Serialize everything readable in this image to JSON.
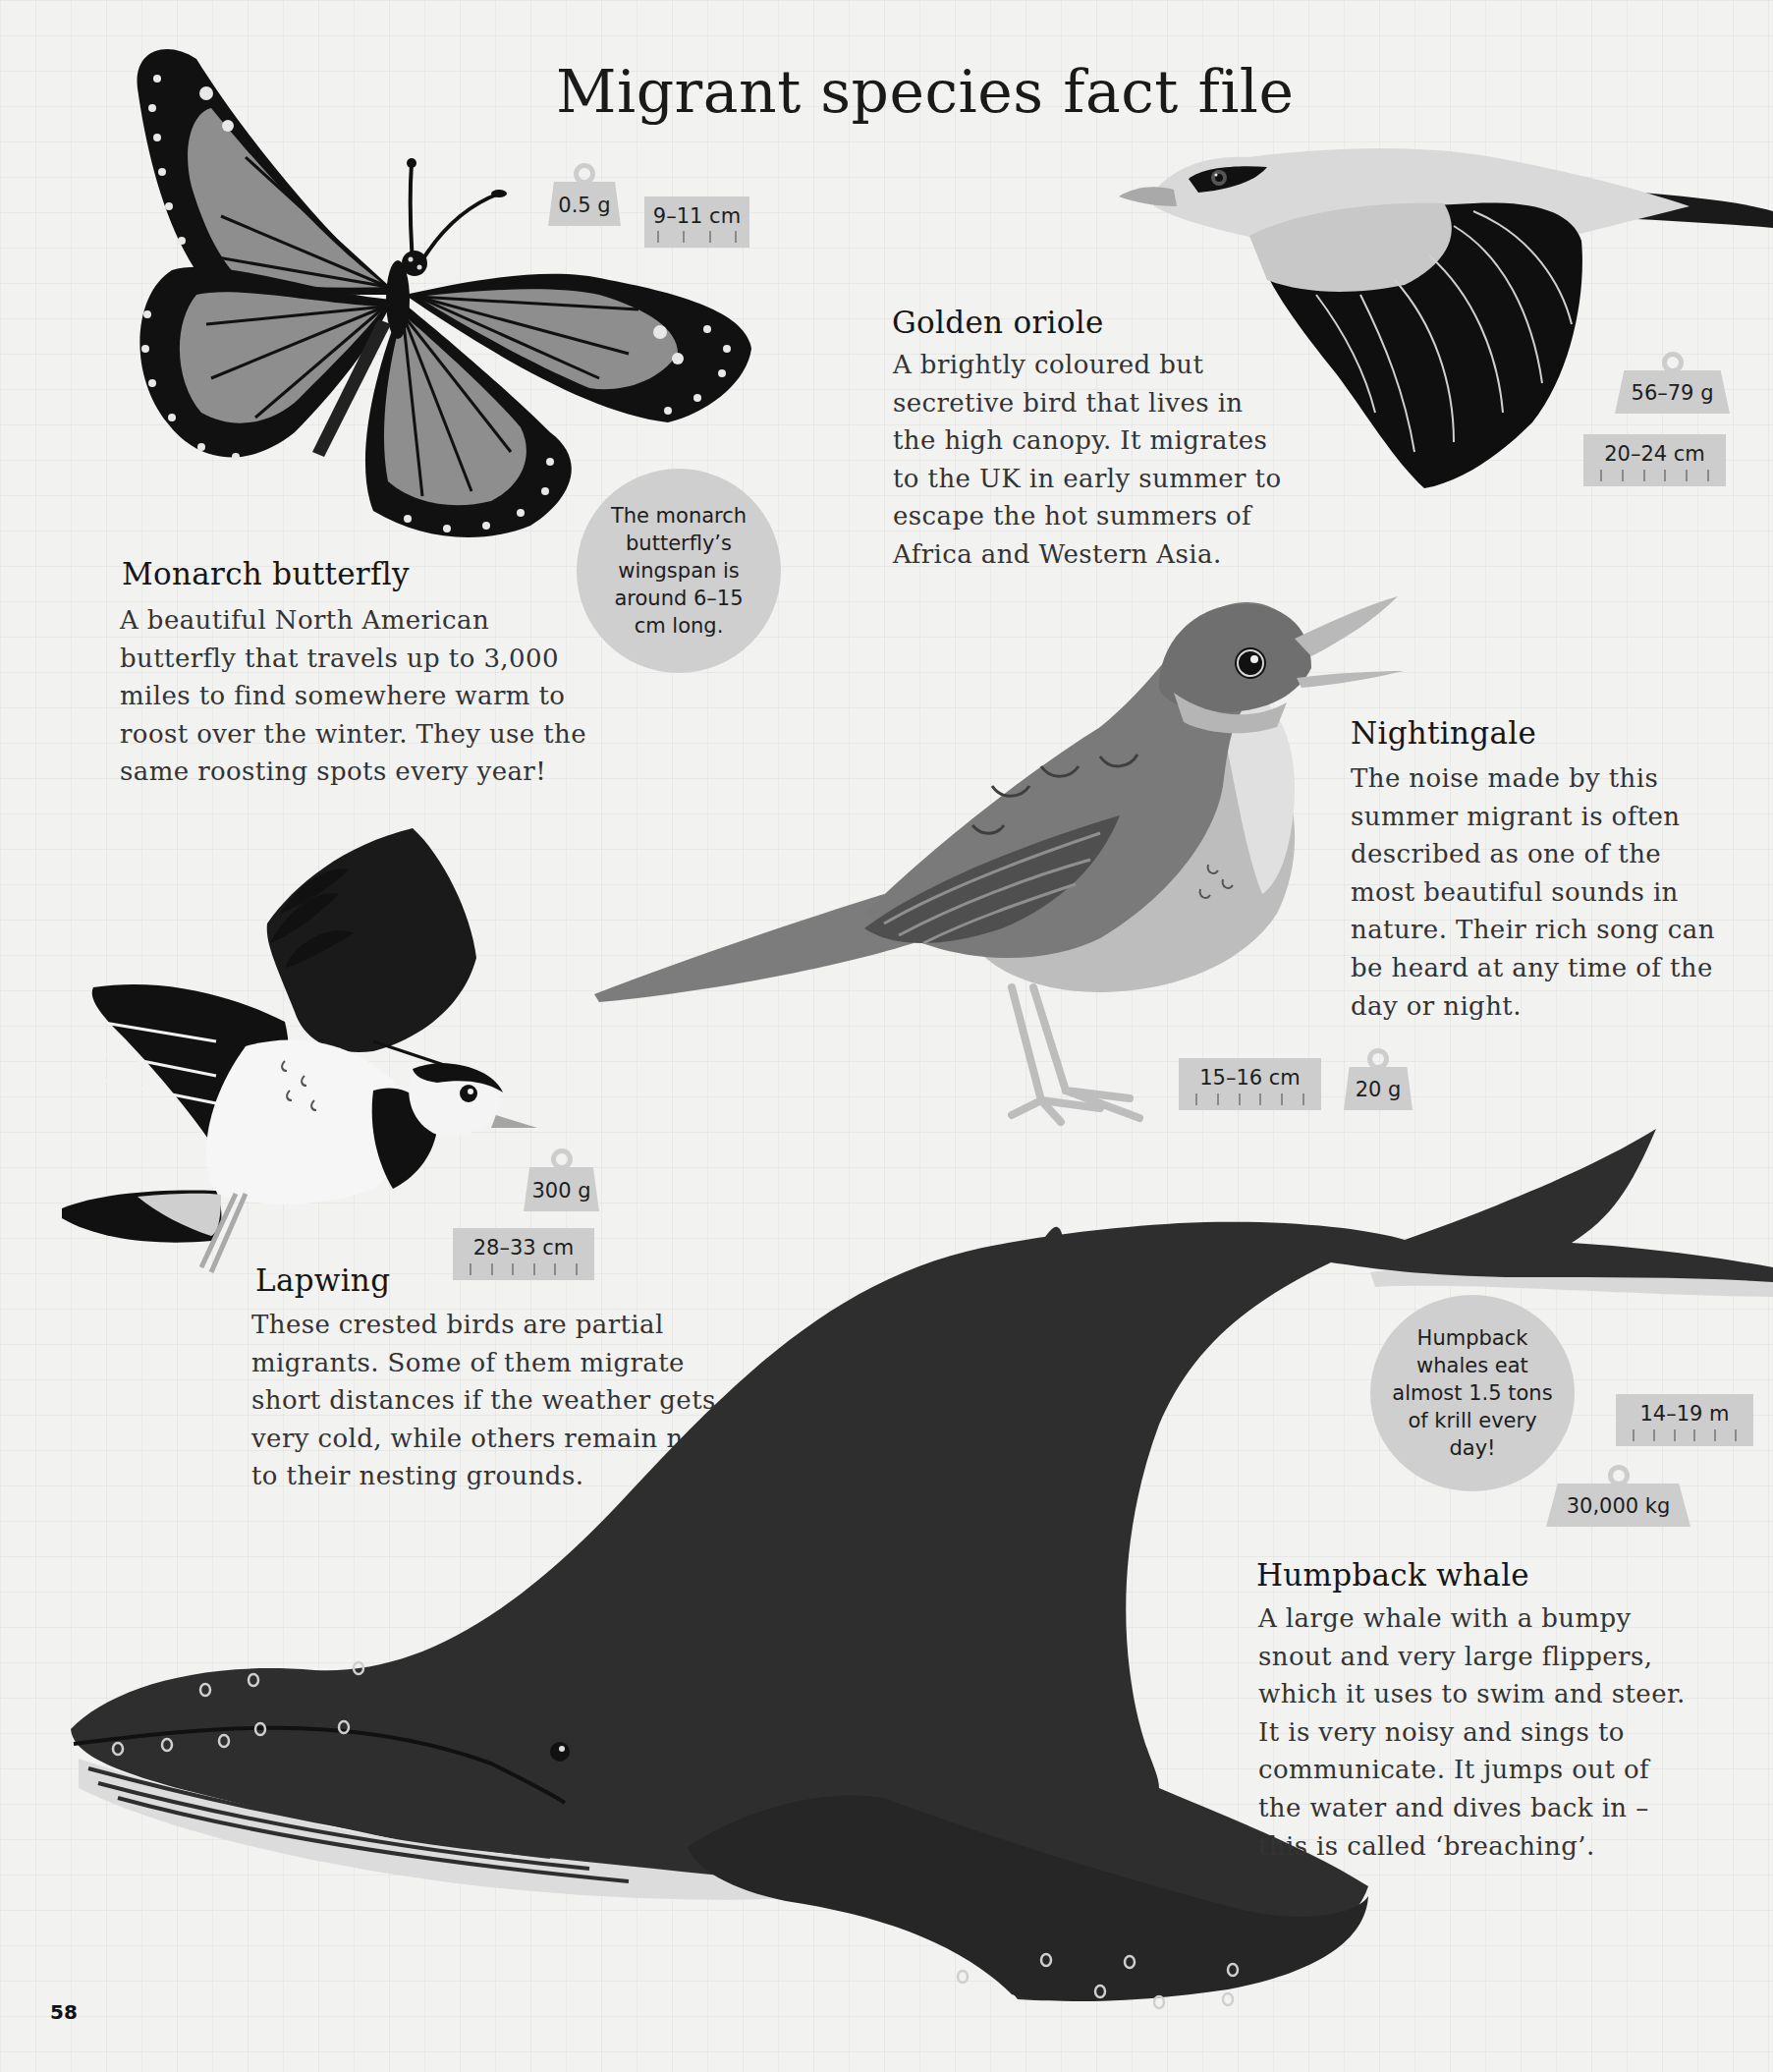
{
  "page": {
    "title": "Migrant species fact file",
    "page_number": "58",
    "colors": {
      "background": "#f2f2f1",
      "grid_line": "#e4e4e4",
      "badge": "#cdcdcd",
      "text": "#1d1d1d"
    }
  },
  "species": {
    "monarch": {
      "name": "Monarch butterfly",
      "body": [
        "A beautiful North American",
        "butterfly that travels up to 3,000",
        "miles to find somewhere warm to",
        "roost over the winter. They use the",
        "same roosting spots every year!"
      ],
      "weight": "0.5 g",
      "length": "9–11 cm",
      "fact_bubble": [
        "The monarch",
        "butterfly’s",
        "wingspan is",
        "around 6–15",
        "cm long."
      ]
    },
    "golden_oriole": {
      "name": "Golden oriole",
      "body": [
        "A brightly coloured but",
        "secretive bird that lives in",
        "the high canopy. It migrates",
        "to the UK in early summer to",
        "escape the hot summers of",
        "Africa and Western Asia."
      ],
      "weight": "56–79 g",
      "length": "20–24 cm"
    },
    "nightingale": {
      "name": "Nightingale",
      "body": [
        "The noise made by this",
        "summer migrant is often",
        "described as one of the",
        "most beautiful sounds in",
        "nature. Their rich song can",
        "be heard at any time of the",
        "day or night."
      ],
      "weight": "20 g",
      "length": "15–16 cm"
    },
    "lapwing": {
      "name": "Lapwing",
      "body": [
        "These crested birds are partial",
        "migrants. Some of them migrate",
        "short distances if the weather gets",
        "very cold, while others remain near",
        "to their nesting grounds."
      ],
      "weight": "300 g",
      "length": "28–33 cm"
    },
    "humpback": {
      "name": "Humpback whale",
      "body": [
        "A large whale with a bumpy",
        "snout and very large flippers,",
        "which it uses to swim and steer.",
        "It is very noisy and sings to",
        "communicate. It jumps out of",
        "the water and dives back in –",
        "this is called ‘breaching’."
      ],
      "weight": "30,000 kg",
      "length": "14–19 m",
      "fact_bubble": [
        "Humpback",
        "whales eat",
        "almost 1.5 tons",
        "of krill every",
        "day!"
      ]
    }
  },
  "illustrations": {
    "monarch": "monarch-butterfly-illustration",
    "golden_oriole": "golden-oriole-illustration",
    "nightingale": "nightingale-illustration",
    "lapwing": "lapwing-illustration",
    "humpback": "humpback-whale-illustration"
  }
}
